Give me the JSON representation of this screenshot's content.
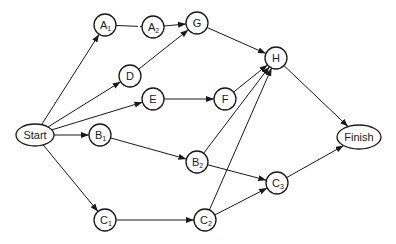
{
  "diagram": {
    "type": "network",
    "colors": {
      "stroke": "#1a1a1a",
      "background": "#ffffff"
    },
    "nodes": [
      {
        "id": "start",
        "label": "Start",
        "sub": "",
        "shape": "ellipse",
        "x": 35,
        "y": 135,
        "rx": 19,
        "ry": 11
      },
      {
        "id": "a1",
        "label": "A",
        "sub": "1",
        "shape": "circle",
        "x": 105,
        "y": 25,
        "r": 11
      },
      {
        "id": "a2",
        "label": "A",
        "sub": "2",
        "shape": "circle",
        "x": 153,
        "y": 27,
        "r": 11
      },
      {
        "id": "g",
        "label": "G",
        "sub": "",
        "shape": "circle",
        "x": 197,
        "y": 23,
        "r": 11
      },
      {
        "id": "d",
        "label": "D",
        "sub": "",
        "shape": "circle",
        "x": 130,
        "y": 76,
        "r": 11
      },
      {
        "id": "e",
        "label": "E",
        "sub": "",
        "shape": "circle",
        "x": 153,
        "y": 99,
        "r": 11
      },
      {
        "id": "f",
        "label": "F",
        "sub": "",
        "shape": "circle",
        "x": 225,
        "y": 99,
        "r": 11
      },
      {
        "id": "h",
        "label": "H",
        "sub": "",
        "shape": "circle",
        "x": 276,
        "y": 58,
        "r": 11
      },
      {
        "id": "b1",
        "label": "B",
        "sub": "1",
        "shape": "circle",
        "x": 100,
        "y": 135,
        "r": 11
      },
      {
        "id": "b2",
        "label": "B",
        "sub": "2",
        "shape": "circle",
        "x": 197,
        "y": 162,
        "r": 11
      },
      {
        "id": "c3",
        "label": "C",
        "sub": "3",
        "shape": "circle",
        "x": 277,
        "y": 183,
        "r": 11
      },
      {
        "id": "c1",
        "label": "C",
        "sub": "1",
        "shape": "circle",
        "x": 105,
        "y": 220,
        "r": 11
      },
      {
        "id": "c2",
        "label": "C",
        "sub": "2",
        "shape": "circle",
        "x": 205,
        "y": 220,
        "r": 11
      },
      {
        "id": "finish",
        "label": "Finish",
        "sub": "",
        "shape": "ellipse",
        "x": 359,
        "y": 137,
        "rx": 22,
        "ry": 12
      }
    ],
    "edges": [
      {
        "from": "start",
        "to": "a1",
        "arrow": true
      },
      {
        "from": "start",
        "to": "d",
        "arrow": true
      },
      {
        "from": "start",
        "to": "e",
        "arrow": true
      },
      {
        "from": "start",
        "to": "b1",
        "arrow": true
      },
      {
        "from": "start",
        "to": "c1",
        "arrow": true
      },
      {
        "from": "a1",
        "to": "a2",
        "arrow": false,
        "dashed_end": true
      },
      {
        "from": "a2",
        "to": "g",
        "arrow": true
      },
      {
        "from": "d",
        "to": "g",
        "arrow": true
      },
      {
        "from": "g",
        "to": "h",
        "arrow": true
      },
      {
        "from": "e",
        "to": "f",
        "arrow": true
      },
      {
        "from": "f",
        "to": "h",
        "arrow": true
      },
      {
        "from": "b2",
        "to": "h",
        "arrow": true
      },
      {
        "from": "c2",
        "to": "h",
        "arrow": true
      },
      {
        "from": "b1",
        "to": "b2",
        "arrow": true
      },
      {
        "from": "b2",
        "to": "c3",
        "arrow": true
      },
      {
        "from": "c1",
        "to": "c2",
        "arrow": true
      },
      {
        "from": "c2",
        "to": "c3",
        "arrow": true
      },
      {
        "from": "h",
        "to": "finish",
        "arrow": true
      },
      {
        "from": "c3",
        "to": "finish",
        "arrow": true
      }
    ]
  }
}
